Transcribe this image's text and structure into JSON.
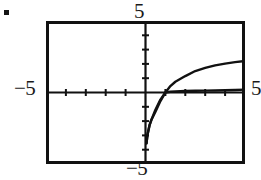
{
  "figure": {
    "bullet": {
      "icon": "square-bullet-icon"
    },
    "window": {
      "xmin": -5,
      "xmax": 5,
      "ymin": -5,
      "ymax": 5,
      "xscl": 1,
      "yscl": 1
    },
    "labels": {
      "ymax": "5",
      "xmin": "−5",
      "ymin": "−5",
      "xmax": "5"
    }
  },
  "chart_data": {
    "type": "line",
    "title": "",
    "subtitle": "",
    "xlabel": "",
    "ylabel": "",
    "xlim": [
      -5,
      5
    ],
    "ylim": [
      -5,
      5
    ],
    "grid": false,
    "legend": null,
    "x_tick_labels": [
      "−5",
      "5"
    ],
    "y_tick_labels": [
      "−5",
      "5"
    ],
    "x_tick_interval": 1,
    "y_tick_interval": 1,
    "axes": {
      "x_axis_at_y": 0,
      "y_axis_at_x": 0
    },
    "series": [
      {
        "name": "upper-curve",
        "note": "logarithmic curve, steep near x=0, passes through (1,0), rises to about y=2.2 at x=5",
        "x": [
          0.05,
          0.1,
          0.2,
          0.3,
          0.5,
          0.75,
          1.0,
          1.25,
          1.5,
          2.0,
          2.5,
          3.0,
          3.5,
          4.0,
          4.5,
          5.0
        ],
        "y": [
          -3.55,
          -2.95,
          -2.3,
          -1.9,
          -1.35,
          -0.6,
          0.0,
          0.45,
          0.75,
          1.15,
          1.5,
          1.72,
          1.9,
          2.02,
          2.12,
          2.2
        ]
      },
      {
        "name": "lower-curve",
        "note": "logarithmic curve, nearly flat after x=1, passes through (1,0), approaches about y=0.2 at x=5",
        "x": [
          0.05,
          0.1,
          0.2,
          0.3,
          0.5,
          0.75,
          1.0,
          1.25,
          1.5,
          2.0,
          2.5,
          3.0,
          3.5,
          4.0,
          4.5,
          5.0
        ],
        "y": [
          -3.55,
          -2.95,
          -2.3,
          -1.9,
          -1.2,
          -0.5,
          0.0,
          0.05,
          0.07,
          0.1,
          0.12,
          0.13,
          0.14,
          0.16,
          0.18,
          0.2
        ]
      }
    ]
  }
}
